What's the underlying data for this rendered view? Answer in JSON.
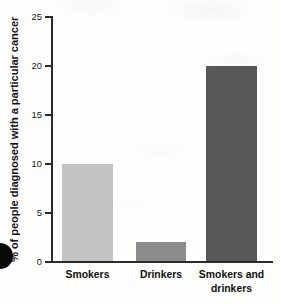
{
  "chart_data": {
    "type": "bar",
    "title": "",
    "subtitle": "",
    "xlabel": "",
    "ylabel": "% of people diagnosed with a particular cancer",
    "categories": [
      "Smokers",
      "Drinkers",
      "Smokers and drinkers"
    ],
    "values": [
      10,
      2,
      20
    ],
    "ylim": [
      0,
      25
    ],
    "yticks": [
      0,
      5,
      10,
      15,
      20,
      25
    ],
    "ytick_labels": [
      "0",
      "5",
      "10",
      "15",
      "20",
      "25"
    ],
    "grid": false,
    "legend": null,
    "annotations": [],
    "bar_colors": [
      "#c3c3c3",
      "#8d8d8d",
      "#585858"
    ],
    "axis_color": "#2b2b2b",
    "background_color": "#fdfdfc",
    "category_label_lines": [
      [
        "Smokers"
      ],
      [
        "Drinkers"
      ],
      [
        "Smokers and",
        "drinkers"
      ]
    ]
  }
}
